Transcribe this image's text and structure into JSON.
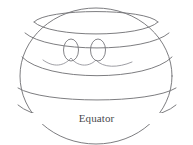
{
  "figure": {
    "kind": "line-diagram",
    "background_color": "#ffffff",
    "stroke_color": "#6e6e72",
    "faint_stroke_color": "#8d8d93",
    "label_color": "#4a4a4e",
    "labels": {
      "equator": "Equator"
    },
    "annotations": [
      {
        "name": "equator-label",
        "text": "Equator",
        "x": 96,
        "y": 118
      }
    ],
    "curves": [
      {
        "name": "sphere-outline",
        "type": "ellipse-outline",
        "cx": 96,
        "cy": 78,
        "rx": 77,
        "ry": 66
      },
      {
        "name": "top-cap-arc",
        "type": "latitude-arc",
        "cy": 18,
        "rx": 62,
        "ry": 15
      },
      {
        "name": "upper-latitude-arc",
        "type": "latitude-arc",
        "cy": 33,
        "rx": 70,
        "ry": 14
      },
      {
        "name": "mid-latitude-arc",
        "type": "latitude-arc",
        "cy": 72,
        "rx": 76,
        "ry": 15
      },
      {
        "name": "lower-latitude-arc",
        "type": "latitude-arc",
        "cy": 97,
        "rx": 78,
        "ry": 14
      },
      {
        "name": "equator-arc",
        "type": "latitude-arc",
        "cy": 113,
        "rx": 79,
        "ry": 13
      },
      {
        "name": "wavy-band-line",
        "type": "freeform-curve",
        "note": "sinuous line crossing the upper-middle band through both loops"
      }
    ],
    "loops": [
      {
        "name": "loop-left",
        "cx": 71,
        "cy": 55,
        "rx": 8,
        "ry": 12
      },
      {
        "name": "loop-right",
        "cx": 98,
        "cy": 55,
        "rx": 8,
        "ry": 12
      }
    ]
  }
}
